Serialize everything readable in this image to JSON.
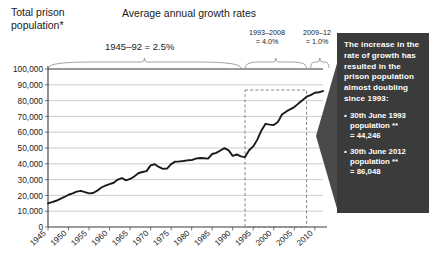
{
  "axis_title": "Total prison\npopulation*",
  "growth_heading": "Average annual growth rates",
  "annotations": {
    "rate_1": "1945–92 = 2.5%",
    "rate_2": "1993–2008\n= 4.0%",
    "rate_3": "2009–12\n= 1.0%"
  },
  "callout": {
    "background": "#3b3b3b",
    "text_color": "#ffffff",
    "body": "The increase in the rate of growth has resulted in the prison population almost doubling since 1993:",
    "bullets": [
      {
        "marker": "•",
        "text": "30th June 1993\npopulation **\n= 44,246"
      },
      {
        "marker": "•",
        "text": "30th June 2012\npopulation **\n= 86,048"
      }
    ]
  },
  "chart_data": {
    "type": "line",
    "title": "Average annual growth rates",
    "xlabel": "",
    "ylabel": "Total prison population*",
    "xlim": [
      1945,
      2012
    ],
    "ylim": [
      0,
      100000
    ],
    "ytick_labels": [
      "0",
      "10,000",
      "20,000",
      "30,000",
      "40,000",
      "50,000",
      "60,000",
      "70,000",
      "80,000",
      "90,000",
      "100,000"
    ],
    "ytick_values": [
      0,
      10000,
      20000,
      30000,
      40000,
      50000,
      60000,
      70000,
      80000,
      90000,
      100000
    ],
    "xtick_labels": [
      "1945",
      "1950",
      "1955",
      "1960",
      "1965",
      "1970",
      "1975",
      "1980",
      "1985",
      "1990",
      "1995",
      "2000",
      "2005",
      "2010"
    ],
    "xtick_values": [
      1945,
      1950,
      1955,
      1960,
      1965,
      1970,
      1975,
      1980,
      1985,
      1990,
      1995,
      2000,
      2005,
      2010
    ],
    "grid": true,
    "legend": "none",
    "line_color": "#1a1a1a",
    "series": [
      {
        "name": "Total prison population",
        "x": [
          1945,
          1946,
          1947,
          1948,
          1949,
          1950,
          1951,
          1952,
          1953,
          1954,
          1955,
          1956,
          1957,
          1958,
          1959,
          1960,
          1961,
          1962,
          1963,
          1964,
          1965,
          1966,
          1967,
          1968,
          1969,
          1970,
          1971,
          1972,
          1973,
          1974,
          1975,
          1976,
          1977,
          1978,
          1979,
          1980,
          1981,
          1982,
          1983,
          1984,
          1985,
          1986,
          1987,
          1988,
          1989,
          1990,
          1991,
          1992,
          1993,
          1994,
          1995,
          1996,
          1997,
          1998,
          1999,
          2000,
          2001,
          2002,
          2003,
          2004,
          2005,
          2006,
          2007,
          2008,
          2009,
          2010,
          2011,
          2012
        ],
        "y": [
          15000,
          15800,
          16600,
          17800,
          19000,
          20400,
          21300,
          22400,
          22900,
          22100,
          21300,
          21500,
          23000,
          25000,
          26200,
          27100,
          28000,
          30000,
          31000,
          29500,
          30400,
          32000,
          34000,
          34800,
          35400,
          39000,
          39700,
          38000,
          36800,
          37000,
          39800,
          41400,
          41500,
          41800,
          42200,
          42300,
          43300,
          43700,
          43500,
          43300,
          46200,
          46900,
          48400,
          49900,
          48500,
          45000,
          45900,
          44700,
          44246,
          48600,
          51000,
          55300,
          61100,
          65300,
          64800,
          64600,
          66400,
          71200,
          73000,
          74500,
          75900,
          78100,
          80200,
          82500,
          83500,
          85000,
          85300,
          86048
        ]
      }
    ],
    "callout_rect": {
      "x_start": 1993,
      "x_end": 2008,
      "style": "dashed"
    },
    "rate_brackets": [
      {
        "label": "1945–92 = 2.5%",
        "x_start": 1945,
        "x_end": 1992,
        "value": 2.5
      },
      {
        "label": "1993–2008 = 4.0%",
        "x_start": 1993,
        "x_end": 2008,
        "value": 4.0
      },
      {
        "label": "2009–12 = 1.0%",
        "x_start": 2009,
        "x_end": 2012,
        "value": 1.0
      }
    ],
    "data_labels": [
      {
        "label": "30th June 1993 population = 44,246",
        "x": 1993,
        "y": 44246
      },
      {
        "label": "30th June 2012 population = 86,048",
        "x": 2012,
        "y": 86048
      }
    ]
  }
}
